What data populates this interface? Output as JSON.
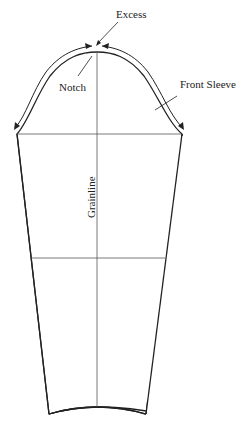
{
  "diagram": {
    "labels": {
      "excess": "Excess",
      "notch": "Notch",
      "front_sleeve": "Front Sleeve",
      "grainline": "Grainline"
    },
    "colors": {
      "outline": "#222222",
      "guide": "#555555",
      "background": "#ffffff"
    }
  }
}
